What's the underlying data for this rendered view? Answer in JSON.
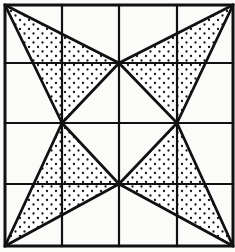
{
  "figure": {
    "type": "geometric-line-drawing",
    "canvas": {
      "width": 235,
      "height": 252
    },
    "colors": {
      "background": "#fbfbf9",
      "stroke": "#111111",
      "fill_stipple_dot": "#111111",
      "fill_region": "#ffffff"
    },
    "square": {
      "label": "outer-square",
      "left": 5,
      "top": 5,
      "right": 233,
      "bottom": 246,
      "stroke_width": 3
    },
    "grid": {
      "label": "four-by-four-grid",
      "columns": 4,
      "rows": 4,
      "vertical_lines_x": [
        62,
        119,
        177
      ],
      "horizontal_lines_y": [
        63,
        123,
        184
      ],
      "stroke_width": 2
    },
    "star": {
      "label": "four-point-star",
      "diamond_vertices": {
        "top": {
          "x": 119,
          "y": 63
        },
        "left": {
          "x": 62,
          "y": 123
        },
        "right": {
          "x": 177,
          "y": 123
        },
        "bottom": {
          "x": 119,
          "y": 184
        }
      },
      "corner_vertices": {
        "top_left": {
          "x": 5,
          "y": 5
        },
        "top_right": {
          "x": 233,
          "y": 5
        },
        "bottom_left": {
          "x": 5,
          "y": 246
        },
        "bottom_right": {
          "x": 233,
          "y": 246
        }
      }
    },
    "shaded_triangles": [
      {
        "name": "top-left-triangle",
        "points": "5,5 119,63 62,123",
        "fill": "stipple"
      },
      {
        "name": "top-right-triangle",
        "points": "233,5 119,63 177,123",
        "fill": "stipple"
      },
      {
        "name": "bottom-left-triangle",
        "points": "5,246 62,123 119,184",
        "fill": "stipple"
      },
      {
        "name": "bottom-right-triangle",
        "points": "233,246 177,123 119,184",
        "fill": "stipple"
      }
    ],
    "star_edges": [
      {
        "name": "edge-tl-corner-to-top",
        "x1": 5,
        "y1": 5,
        "x2": 119,
        "y2": 63
      },
      {
        "name": "edge-tl-corner-to-left",
        "x1": 5,
        "y1": 5,
        "x2": 62,
        "y2": 123
      },
      {
        "name": "edge-tr-corner-to-top",
        "x1": 233,
        "y1": 5,
        "x2": 119,
        "y2": 63
      },
      {
        "name": "edge-tr-corner-to-right",
        "x1": 233,
        "y1": 5,
        "x2": 177,
        "y2": 123
      },
      {
        "name": "edge-bl-corner-to-left",
        "x1": 5,
        "y1": 246,
        "x2": 62,
        "y2": 123
      },
      {
        "name": "edge-bl-corner-to-bottom",
        "x1": 5,
        "y1": 246,
        "x2": 119,
        "y2": 184
      },
      {
        "name": "edge-br-corner-to-right",
        "x1": 233,
        "y1": 246,
        "x2": 177,
        "y2": 123
      },
      {
        "name": "edge-br-corner-to-bottom",
        "x1": 233,
        "y1": 246,
        "x2": 119,
        "y2": 184
      },
      {
        "name": "edge-top-to-left",
        "x1": 119,
        "y1": 63,
        "x2": 62,
        "y2": 123
      },
      {
        "name": "edge-top-to-right",
        "x1": 119,
        "y1": 63,
        "x2": 177,
        "y2": 123
      },
      {
        "name": "edge-left-to-bottom",
        "x1": 62,
        "y1": 123,
        "x2": 119,
        "y2": 184
      },
      {
        "name": "edge-right-to-bottom",
        "x1": 177,
        "y1": 123,
        "x2": 119,
        "y2": 184
      }
    ]
  }
}
